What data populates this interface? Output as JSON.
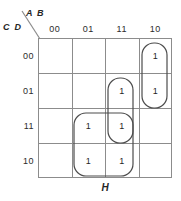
{
  "axes": {
    "top_label": "A B",
    "left_label": "C D",
    "column_headers": [
      "00",
      "01",
      "11",
      "10"
    ],
    "row_headers": [
      "00",
      "01",
      "11",
      "10"
    ],
    "bottom_label": "H"
  },
  "cells": [
    {
      "row": "00",
      "col": "00",
      "value": ""
    },
    {
      "row": "00",
      "col": "01",
      "value": ""
    },
    {
      "row": "00",
      "col": "11",
      "value": ""
    },
    {
      "row": "00",
      "col": "10",
      "value": "1"
    },
    {
      "row": "01",
      "col": "00",
      "value": ""
    },
    {
      "row": "01",
      "col": "01",
      "value": ""
    },
    {
      "row": "01",
      "col": "11",
      "value": "1"
    },
    {
      "row": "01",
      "col": "10",
      "value": "1"
    },
    {
      "row": "11",
      "col": "00",
      "value": ""
    },
    {
      "row": "11",
      "col": "01",
      "value": "1"
    },
    {
      "row": "11",
      "col": "11",
      "value": "1"
    },
    {
      "row": "11",
      "col": "10",
      "value": ""
    },
    {
      "row": "10",
      "col": "00",
      "value": ""
    },
    {
      "row": "10",
      "col": "01",
      "value": "1"
    },
    {
      "row": "10",
      "col": "11",
      "value": "1"
    },
    {
      "row": "10",
      "col": "10",
      "value": ""
    }
  ],
  "groups": [
    {
      "name": "group-col10-rows00-01",
      "shape": "rounded-rect",
      "x": 142,
      "y": 43,
      "width": 25,
      "height": 65,
      "radius": 12
    },
    {
      "name": "group-col11-rows01-11",
      "shape": "rounded-rect",
      "x": 108,
      "y": 78,
      "width": 25,
      "height": 65,
      "radius": 12
    },
    {
      "name": "group-cols01-11-rows11-10",
      "shape": "rounded-rect",
      "x": 74,
      "y": 113,
      "width": 59,
      "height": 63,
      "radius": 12
    }
  ],
  "style": {
    "grid_line_color": "#8c8c8c",
    "group_stroke_color": "#4c4c4c",
    "text_color": "#1f1f1f",
    "background": "#ffffff"
  }
}
